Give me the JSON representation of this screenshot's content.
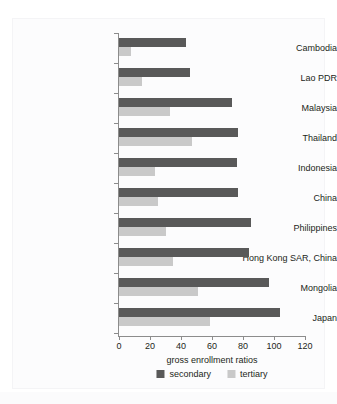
{
  "figure": {
    "top_artifact_text": "",
    "background_color": "#ffffff",
    "panel_color": "#fcfcfd"
  },
  "chart_data": {
    "type": "bar",
    "orientation": "horizontal",
    "title": "",
    "xlabel": "gross enrollment ratios",
    "ylabel": "",
    "xlim": [
      0,
      120
    ],
    "ylim": [],
    "grid": false,
    "legend_position": "bottom",
    "xticks": [
      0,
      20,
      40,
      60,
      80,
      100,
      120
    ],
    "xtick_labels": [
      "0",
      "20",
      "40",
      "60",
      "80",
      "100",
      "120"
    ],
    "categories": [
      "Cambodia",
      "Lao PDR",
      "Malaysia",
      "Thailand",
      "Indonesia",
      "China",
      "Philippines",
      "Hong Kong SAR, China",
      "Mongolia",
      "Japan"
    ],
    "series": [
      {
        "name": "secondary",
        "color": "#595959",
        "values": [
          43,
          46,
          73,
          77,
          76,
          77,
          85,
          84,
          97,
          104
        ]
      },
      {
        "name": "tertiary",
        "color": "#c9c9c9",
        "values": [
          8,
          15,
          33,
          47,
          23,
          25,
          30,
          35,
          51,
          59
        ]
      }
    ]
  },
  "legend": {
    "items": [
      {
        "label": "secondary",
        "color": "#595959"
      },
      {
        "label": "tertiary",
        "color": "#c9c9c9"
      }
    ]
  }
}
